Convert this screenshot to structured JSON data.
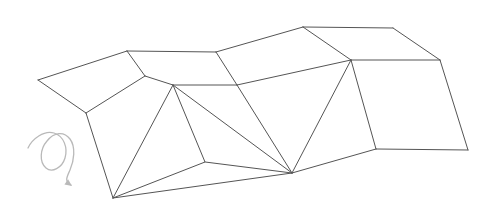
{
  "figure": {
    "background_color": "#ffffff",
    "canvas": {
      "width": 496,
      "height": 222
    },
    "line_color": "#555555",
    "line_color_light": "#6b6b6b",
    "face_fill": "#ffffff",
    "line_width": 1.0,
    "annotation_color": "#b9b9b9",
    "annotation_width": 1.3
  },
  "geometry": {
    "vertices": {
      "A_left_tip": {
        "x": 38,
        "y": 80,
        "label": "A"
      },
      "B_top_fold_1": {
        "x": 127,
        "y": 51,
        "label": "B"
      },
      "C_top_fold_2": {
        "x": 216,
        "y": 52,
        "label": "C"
      },
      "D_top_peak": {
        "x": 303,
        "y": 27,
        "label": "D"
      },
      "E_top_right": {
        "x": 393,
        "y": 28,
        "label": "E"
      },
      "F_right_upper": {
        "x": 440,
        "y": 60,
        "label": "F"
      },
      "G_right_lower": {
        "x": 468,
        "y": 150,
        "label": "G"
      },
      "H_bottom_right": {
        "x": 376,
        "y": 149,
        "label": "H"
      },
      "I_mid_right_top": {
        "x": 351,
        "y": 60,
        "label": "I"
      },
      "J_fan_apex": {
        "x": 292,
        "y": 173,
        "label": "J"
      },
      "K_mid_ridge": {
        "x": 237,
        "y": 85,
        "label": "K"
      },
      "L_mid_left_ridge": {
        "x": 173,
        "y": 85,
        "label": "L"
      },
      "M_bottom_left": {
        "x": 113,
        "y": 198,
        "label": "M"
      },
      "N_left_lower": {
        "x": 86,
        "y": 113,
        "label": "N"
      },
      "O_left_mid_edge": {
        "x": 145,
        "y": 76,
        "label": "O"
      }
    },
    "faces": [
      {
        "name": "face-upper-left-panel",
        "points": "38,80 127,51 145,76 86,113"
      },
      {
        "name": "face-upper-mid-left",
        "points": "127,51 216,52 237,85 145,76"
      },
      {
        "name": "face-upper-mid-right",
        "points": "216,52 303,27 351,60 237,85"
      },
      {
        "name": "face-upper-right-panel",
        "points": "303,27 393,28 440,60 351,60"
      },
      {
        "name": "face-lower-left-panel",
        "points": "86,113 173,85 205,162 113,198"
      },
      {
        "name": "face-lower-right-panel",
        "points": "351,60 440,60 468,150 376,149"
      },
      {
        "name": "face-fan-triangle-1",
        "points": "173,85 237,85 292,173"
      },
      {
        "name": "face-fan-triangle-2",
        "points": "237,85 351,60 292,173"
      },
      {
        "name": "face-fan-triangle-3",
        "points": "351,60 376,149 292,173"
      }
    ],
    "edges": [
      {
        "name": "edge-A-B-top-left",
        "from": "A_left_tip",
        "to": "B_top_fold_1"
      },
      {
        "name": "edge-B-C-top",
        "from": "B_top_fold_1",
        "to": "C_top_fold_2"
      },
      {
        "name": "edge-C-D-top-rise",
        "from": "C_top_fold_2",
        "to": "D_top_peak"
      },
      {
        "name": "edge-D-E-top-ridge",
        "from": "D_top_peak",
        "to": "E_top_right"
      },
      {
        "name": "edge-E-F-right-slope",
        "from": "E_top_right",
        "to": "F_right_upper"
      },
      {
        "name": "edge-F-G-right-side",
        "from": "F_right_upper",
        "to": "G_right_lower"
      },
      {
        "name": "edge-G-H-bottom-right",
        "from": "G_right_lower",
        "to": "H_bottom_right"
      },
      {
        "name": "edge-H-J-bottom",
        "from": "H_bottom_right",
        "to": "J_fan_apex"
      },
      {
        "name": "edge-J-M-bottom-left",
        "from": "J_fan_apex",
        "to": "M_bottom_left"
      },
      {
        "name": "edge-M-N-left-side",
        "from": "M_bottom_left",
        "to": "N_left_lower"
      },
      {
        "name": "edge-N-A-left-tip",
        "from": "N_left_lower",
        "to": "A_left_tip"
      },
      {
        "name": "edge-B-O-fold",
        "from": "B_top_fold_1",
        "to": "O_left_mid_edge"
      },
      {
        "name": "edge-C-K-fold",
        "from": "C_top_fold_2",
        "to": "K_mid_ridge"
      },
      {
        "name": "edge-D-I-fold",
        "from": "D_top_peak",
        "to": "I_mid_right_top"
      },
      {
        "name": "edge-N-O-ridge-left",
        "from": "N_left_lower",
        "to": "O_left_mid_edge"
      },
      {
        "name": "edge-O-L-ridge",
        "from": "O_left_mid_edge",
        "to": "L_mid_left_ridge"
      },
      {
        "name": "edge-L-K-ridge-mid",
        "from": "L_mid_left_ridge",
        "to": "K_mid_ridge"
      },
      {
        "name": "edge-K-I-ridge-right",
        "from": "K_mid_ridge",
        "to": "I_mid_right_top"
      },
      {
        "name": "edge-I-F-ridge-far-right",
        "from": "I_mid_right_top",
        "to": "F_right_upper"
      },
      {
        "name": "edge-I-H-right-fold",
        "from": "I_mid_right_top",
        "to": "H_bottom_right"
      },
      {
        "name": "edge-L-M-left-fold",
        "from": "L_mid_left_ridge",
        "to": "M_bottom_left"
      },
      {
        "name": "edge-L-J-crease-diagonal",
        "from": "L_mid_left_ridge",
        "to": "J_fan_apex"
      },
      {
        "name": "edge-K-J-crease",
        "from": "K_mid_ridge",
        "to": "J_fan_apex"
      },
      {
        "name": "edge-I-J-crease",
        "from": "I_mid_right_top",
        "to": "J_fan_apex"
      },
      {
        "name": "edge-L-lowerleft-valley",
        "from": "L_mid_left_ridge",
        "to": "valley_pt"
      }
    ],
    "extra_paths": [
      {
        "name": "path-lower-left-valley-fold",
        "d": "M 173,85 L 205,162 L 113,198"
      },
      {
        "name": "path-lower-left-bottom-edge",
        "d": "M 205,162 L 292,173"
      }
    ]
  },
  "annotation": {
    "rotation_arrow": {
      "name": "rotation-arrow",
      "description": "curved looping rotation arrow indicating fold direction",
      "color": "#b9b9b9",
      "loop_path": "M 28,148 C 32,139 44,130 54,133 C 64,136 68,148 65,158 C 62,168 52,173 46,168 C 39,162 40,149 47,141 C 54,132 64,131 70,139 C 76,147 74,161 70,170 C 67,177 64,181 71,185",
      "arrow_tip": {
        "x": 72,
        "y": 186
      },
      "arrow_angle_deg": 35
    }
  }
}
